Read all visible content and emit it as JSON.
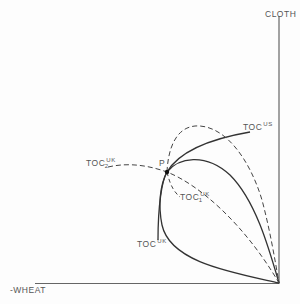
{
  "axes": {
    "y_label": "CLOTH",
    "x_label": "-WHEAT"
  },
  "point": {
    "label": "P"
  },
  "curves": {
    "toc_us": {
      "base": "TOC",
      "sup": "US",
      "style": "solid"
    },
    "toc_uk": {
      "base": "TOC",
      "sup": "UK",
      "style": "solid"
    },
    "toc_uk_1": {
      "base": "TOC",
      "sup": "UK",
      "sub": "1",
      "style": "dashed"
    },
    "toc_uk_2": {
      "base": "TOC",
      "sup": "UK",
      "sub": "2",
      "style": "dashed"
    }
  },
  "colors": {
    "line": "#333333",
    "axis": "#555555"
  }
}
